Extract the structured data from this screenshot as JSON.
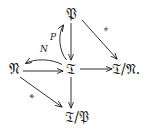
{
  "diagram": {
    "kind": "commutative-diagram",
    "background_color": "#ffffff",
    "ink_color": "#1a1a1a",
    "nodes": [
      {
        "id": "P",
        "label": "𝔓",
        "x": 71,
        "y": 14
      },
      {
        "id": "N",
        "label": "𝔑",
        "x": 14,
        "y": 69
      },
      {
        "id": "T",
        "label": "𝔗",
        "x": 71,
        "y": 69
      },
      {
        "id": "TmodN",
        "label": "𝔗/𝔑.",
        "x": 126,
        "y": 69
      },
      {
        "id": "TmodP",
        "label": "𝔗/𝔓",
        "x": 77,
        "y": 117
      }
    ],
    "arrow_labels": [
      {
        "id": "label-N",
        "text": "N",
        "x": 44,
        "y": 49
      },
      {
        "id": "label-P",
        "text": "P",
        "x": 53,
        "y": 37
      },
      {
        "id": "label-iso-tr",
        "text": "≅",
        "x": 106,
        "y": 29
      },
      {
        "id": "label-iso-bl",
        "text": "≅",
        "x": 32,
        "y": 96
      }
    ],
    "edges": [
      {
        "id": "edge-P-to-T",
        "from": "P",
        "to": "T",
        "style": "straight-down"
      },
      {
        "id": "edge-T-to-P",
        "from": "T",
        "to": "P",
        "style": "curved-up",
        "label": "P"
      },
      {
        "id": "edge-N-to-T",
        "from": "N",
        "to": "T",
        "style": "straight-right"
      },
      {
        "id": "edge-T-to-N",
        "from": "T",
        "to": "N",
        "style": "curved-left",
        "label": "N"
      },
      {
        "id": "edge-T-to-TmodN",
        "from": "T",
        "to": "TmodN",
        "style": "straight-right"
      },
      {
        "id": "edge-T-to-TmodP",
        "from": "T",
        "to": "TmodP",
        "style": "straight-down"
      },
      {
        "id": "edge-P-to-TmodN",
        "from": "P",
        "to": "TmodN",
        "style": "diagonal",
        "label": "≅"
      },
      {
        "id": "edge-N-to-TmodP",
        "from": "N",
        "to": "TmodP",
        "style": "diagonal",
        "label": "≅"
      }
    ]
  }
}
